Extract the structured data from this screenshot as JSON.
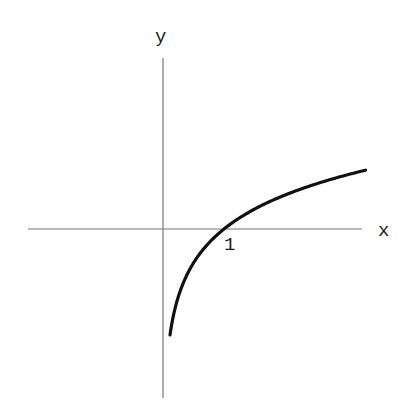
{
  "figure": {
    "function": "y = ln(x)",
    "x_axis_label": "x",
    "y_axis_label": "y",
    "tick_labels": [
      {
        "text": "1",
        "x_value": 1
      }
    ],
    "colors": {
      "curve": "#111111",
      "axis": "#777777",
      "text": "#222222"
    }
  },
  "geometry": {
    "origin_px": [
      163,
      229
    ],
    "x_unit_px": 61,
    "y_unit_px": 49,
    "x_axis_px": [
      28,
      362
    ],
    "y_axis_px": [
      58,
      398
    ],
    "curve_x_range": [
      0.115,
      3.32
    ],
    "x_label_pos": [
      378,
      236
    ],
    "y_label_pos": [
      155,
      42
    ],
    "tick1_label_pos": [
      224,
      250
    ]
  },
  "chart_data": {
    "type": "line",
    "title": "",
    "xlabel": "x",
    "ylabel": "y",
    "series": [
      {
        "name": "ln x",
        "x": [
          0.115,
          0.2,
          0.3,
          0.5,
          0.75,
          1,
          1.5,
          2,
          2.5,
          3,
          3.32
        ],
        "values": [
          -2.16,
          -1.61,
          -1.2,
          -0.69,
          -0.29,
          0,
          0.41,
          0.69,
          0.92,
          1.1,
          1.2
        ]
      }
    ],
    "annotations": [
      "1"
    ],
    "grid": false,
    "legend": "none"
  }
}
